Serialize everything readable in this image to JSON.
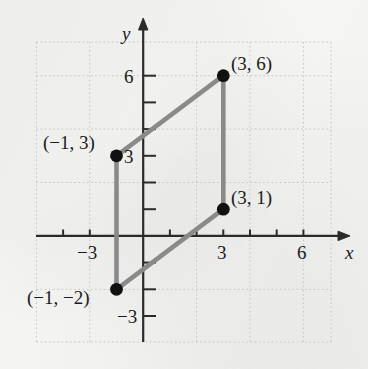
{
  "figure": {
    "kind": "coordinate-plane-parallelogram",
    "background_color": "#f6f6f4",
    "grid_color": "#c9c9c9",
    "axis_color": "#2b2b2b",
    "shape_color": "#8a8a8a",
    "point_color": "#111111",
    "axes": {
      "x_axis_label": "x",
      "y_axis_label": "y",
      "x_ticks": [
        {
          "value": -3,
          "label": "−3"
        },
        {
          "value": 3,
          "label": "3"
        },
        {
          "value": 6,
          "label": "6"
        }
      ],
      "y_ticks": [
        {
          "value": 6,
          "label": "6"
        },
        {
          "value": 3,
          "label": "3"
        },
        {
          "value": -3,
          "label": "−3"
        }
      ],
      "x_range": [
        -4.2,
        7.0
      ],
      "y_range": [
        -4.0,
        7.3
      ],
      "tick_step": 1,
      "grid_step": 2,
      "grid_style": "dotted"
    },
    "vertices": [
      {
        "label": "(−1, 3)",
        "x": -1,
        "y": 3
      },
      {
        "label": "(3, 6)",
        "x": 3,
        "y": 6
      },
      {
        "label": "(3, 1)",
        "x": 3,
        "y": 1
      },
      {
        "label": "(−1, −2)",
        "x": -1,
        "y": -2
      }
    ]
  }
}
